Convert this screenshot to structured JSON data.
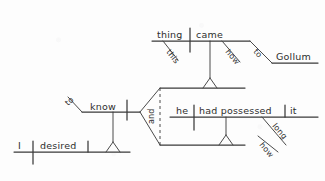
{
  "diagram": {
    "type": "reed-kellogg-sentence-diagram",
    "sentence": "I desired to know how this thing came to Gollum and how long he had possessed it",
    "ink_color": "#2e2e2e",
    "paper_color": "#fdfdfd",
    "clauses": {
      "main": {
        "name": "main-clause",
        "subject": "I",
        "verb": "desired"
      },
      "infinitive": {
        "name": "infinitive-phrase",
        "particle": "to",
        "verb": "know"
      },
      "conjunction": {
        "name": "coordinating-conjunction",
        "word": "and"
      },
      "upper_subordinate": {
        "name": "upper-subordinate-clause",
        "subject": "thing",
        "determiner": "this",
        "verb": "came",
        "adverb": "how",
        "preposition": "to",
        "object_of_preposition": "Gollum"
      },
      "lower_subordinate": {
        "name": "lower-subordinate-clause",
        "subject": "he",
        "verb": "had possessed",
        "object": "it",
        "adverb": "long",
        "adverb_modifier": "how"
      }
    },
    "words": {
      "i": "I",
      "desired": "desired",
      "to_1": "to",
      "know": "know",
      "and": "and",
      "this": "this",
      "thing": "thing",
      "came": "came",
      "how_1": "how",
      "to_2": "to",
      "gollum": "Gollum",
      "he": "he",
      "had_possessed": "had possessed",
      "it": "it",
      "long": "long",
      "how_2": "how"
    }
  }
}
